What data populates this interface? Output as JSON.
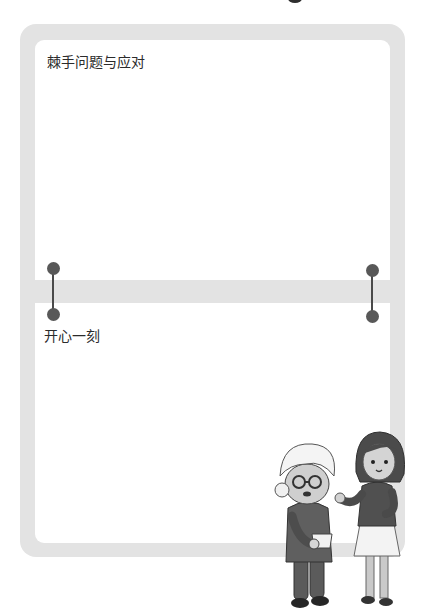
{
  "page": {
    "sections": [
      {
        "title": "棘手问题与应对"
      },
      {
        "title": "开心一刻"
      }
    ],
    "illustration": {
      "description": "elderly woman holding a cup and a girl gesturing"
    }
  },
  "colors": {
    "frame": "#e3e3e3",
    "background": "#ffffff",
    "ring": "#585858",
    "text": "#2b2b2b"
  }
}
